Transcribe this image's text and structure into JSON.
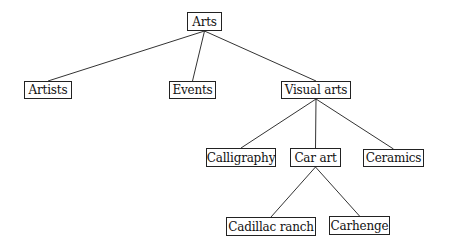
{
  "diagram": {
    "type": "tree",
    "background": "#ffffff",
    "nodes": [
      {
        "id": "arts",
        "label": "Arts",
        "x": 187,
        "y": 12,
        "w": 35,
        "h": 19
      },
      {
        "id": "artists",
        "label": "Artists",
        "x": 24,
        "y": 81,
        "w": 48,
        "h": 18
      },
      {
        "id": "events",
        "label": "Events",
        "x": 169,
        "y": 81,
        "w": 47,
        "h": 18
      },
      {
        "id": "visual_arts",
        "label": "Visual arts",
        "x": 281,
        "y": 81,
        "w": 70,
        "h": 18
      },
      {
        "id": "calligraphy",
        "label": "Calligraphy",
        "x": 206,
        "y": 148,
        "w": 70,
        "h": 19
      },
      {
        "id": "car_art",
        "label": "Car art",
        "x": 290,
        "y": 148,
        "w": 51,
        "h": 19
      },
      {
        "id": "ceramics",
        "label": "Ceramics",
        "x": 363,
        "y": 149,
        "w": 61,
        "h": 18
      },
      {
        "id": "cadillac_ranch",
        "label": "Cadillac ranch",
        "x": 226,
        "y": 217,
        "w": 90,
        "h": 19
      },
      {
        "id": "carhenge",
        "label": "Carhenge",
        "x": 329,
        "y": 216,
        "w": 61,
        "h": 19
      }
    ],
    "edges": [
      {
        "from": "arts",
        "to": "artists"
      },
      {
        "from": "arts",
        "to": "events"
      },
      {
        "from": "arts",
        "to": "visual_arts"
      },
      {
        "from": "visual_arts",
        "to": "calligraphy"
      },
      {
        "from": "visual_arts",
        "to": "car_art"
      },
      {
        "from": "visual_arts",
        "to": "ceramics"
      },
      {
        "from": "car_art",
        "to": "cadillac_ranch"
      },
      {
        "from": "car_art",
        "to": "carhenge"
      }
    ]
  }
}
